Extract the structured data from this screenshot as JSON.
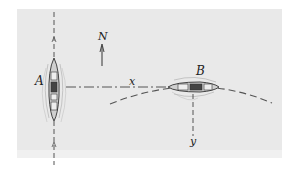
{
  "diagram": {
    "labels": {
      "ship_a": "A",
      "ship_b": "B",
      "north": "N",
      "x_axis": "x",
      "y_axis": "y"
    },
    "colors": {
      "background": "#e9e9e9",
      "line": "#555555",
      "ship_fill": "#d8d8d8",
      "ship_dark": "#333333"
    },
    "elements": {
      "ship_a": {
        "orientation": "vertical",
        "heading": "north",
        "center": [
          54,
          90
        ]
      },
      "ship_b": {
        "orientation": "horizontal",
        "heading": "east",
        "center": [
          195,
          87
        ]
      },
      "x_axis": {
        "style": "dash-dot",
        "from": [
          66,
          87
        ],
        "to": [
          190,
          87
        ]
      },
      "y_axis": {
        "style": "dashed",
        "from": [
          193,
          97
        ],
        "to": [
          193,
          138
        ]
      },
      "ship_a_track": {
        "style": "dashed",
        "orientation": "vertical",
        "x": 54
      },
      "ship_b_track": {
        "style": "dashed",
        "shape": "circular-arc"
      },
      "north_arrow": {
        "x": 102,
        "from_y": 66,
        "to_y": 45
      }
    }
  }
}
